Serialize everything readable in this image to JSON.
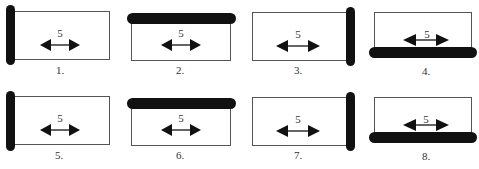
{
  "diagram": {
    "colors": {
      "bar": "#111111",
      "outline": "#555555",
      "arrow": "#111111",
      "text": "#333333"
    },
    "panels": [
      {
        "label": "1.",
        "arrow_label": "5",
        "bar_side": "left"
      },
      {
        "label": "2.",
        "arrow_label": "5",
        "bar_side": "top"
      },
      {
        "label": "3.",
        "arrow_label": "5",
        "bar_side": "right"
      },
      {
        "label": "4.",
        "arrow_label": "5",
        "bar_side": "bottom"
      },
      {
        "label": "5.",
        "arrow_label": "5",
        "bar_side": "left"
      },
      {
        "label": "6.",
        "arrow_label": "5",
        "bar_side": "top"
      },
      {
        "label": "7.",
        "arrow_label": "5",
        "bar_side": "right"
      },
      {
        "label": "8.",
        "arrow_label": "5",
        "bar_side": "bottom"
      }
    ]
  }
}
